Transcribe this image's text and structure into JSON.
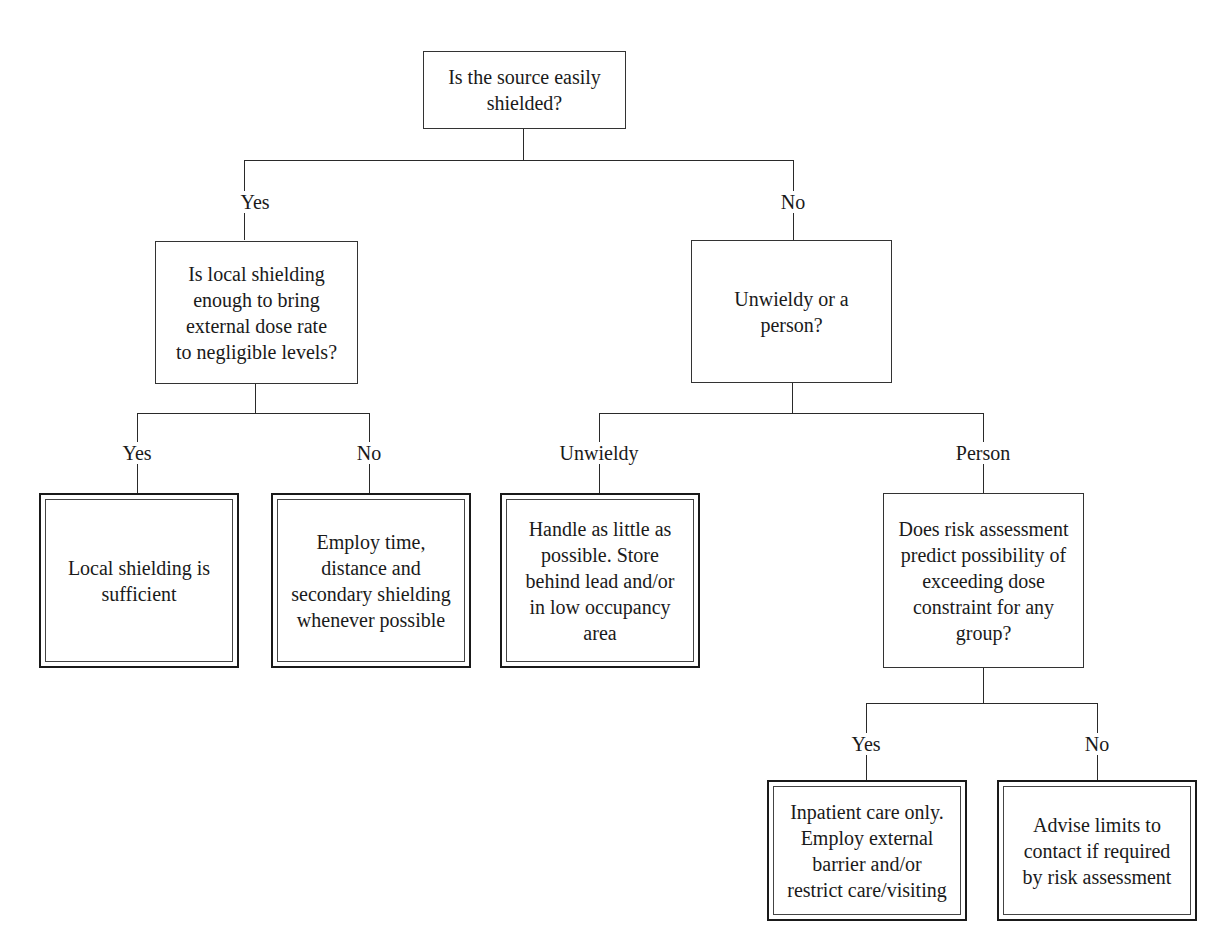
{
  "diagram": {
    "type": "decision-tree",
    "nodes": {
      "root": {
        "kind": "question",
        "text": "Is the source easily\nshielded?"
      },
      "local_shielding_q": {
        "kind": "question",
        "text": "Is local shielding\nenough to bring\nexternal dose rate\nto negligible levels?"
      },
      "unwieldy_q": {
        "kind": "question",
        "text": "Unwieldy or a\nperson?"
      },
      "local_sufficient": {
        "kind": "terminal",
        "text": "Local shielding is\nsufficient"
      },
      "employ_time": {
        "kind": "terminal",
        "text": "Employ time,\ndistance and\nsecondary shielding\nwhenever possible"
      },
      "handle_little": {
        "kind": "terminal",
        "text": "Handle as little as\npossible. Store\nbehind lead and/or\nin low occupancy\narea"
      },
      "risk_q": {
        "kind": "question",
        "text": "Does risk assessment\npredict possibility of\nexceeding dose\nconstraint for any\ngroup?"
      },
      "inpatient": {
        "kind": "terminal",
        "text": "Inpatient care only.\nEmploy external\nbarrier and/or\nrestrict care/visiting"
      },
      "advise_limits": {
        "kind": "terminal",
        "text": "Advise limits to\ncontact if required\nby risk assessment"
      }
    },
    "edges": [
      {
        "from": "root",
        "to": "local_shielding_q",
        "label": "Yes"
      },
      {
        "from": "root",
        "to": "unwieldy_q",
        "label": "No"
      },
      {
        "from": "local_shielding_q",
        "to": "local_sufficient",
        "label": "Yes"
      },
      {
        "from": "local_shielding_q",
        "to": "employ_time",
        "label": "No"
      },
      {
        "from": "unwieldy_q",
        "to": "handle_little",
        "label": "Unwieldy"
      },
      {
        "from": "unwieldy_q",
        "to": "risk_q",
        "label": "Person"
      },
      {
        "from": "risk_q",
        "to": "inpatient",
        "label": "Yes"
      },
      {
        "from": "risk_q",
        "to": "advise_limits",
        "label": "No"
      }
    ]
  },
  "labels": {
    "root_yes": "Yes",
    "root_no": "No",
    "local_yes": "Yes",
    "local_no": "No",
    "unwieldy": "Unwieldy",
    "person": "Person",
    "risk_yes": "Yes",
    "risk_no": "No"
  },
  "colors": {
    "line": "#2a2a2a",
    "text": "#1a1a1a",
    "background": "#ffffff"
  }
}
